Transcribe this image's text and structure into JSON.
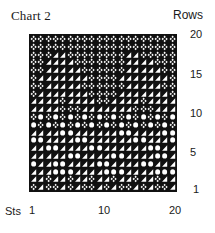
{
  "chart_data": {
    "type": "table",
    "title": "Chart 2",
    "xlabel": "Sts",
    "ylabel": "Rows",
    "x_ticks": [
      "1",
      "10",
      "20"
    ],
    "y_ticks": [
      "20",
      "15",
      "10",
      "5",
      "1"
    ],
    "columns": 20,
    "rows": 20,
    "legend": {
      "x": "lattice cross",
      "t": "triangle",
      "o": "circle"
    },
    "grid_rows_top_to_bottom": [
      "xxxxxxxxxxxxxxxxxxxx",
      "xxxxxxxxxxxxxxxxxxxx",
      "xxxttxxxxxxxxttxxxxx",
      "xxttttxxxxxxxttttxxx",
      "xxtttttxxxxxxtttttxx",
      "xtttttttxxxxtttttttx",
      "xxtttttxxxxxxtttttxx",
      "xtttttttxxxxtttttttx",
      "ttttxttttxxttttxtttt",
      "ttttxxxtttttttxxxttt",
      "xoxoxoxoxoxoxoxoxoxo",
      "oxoxoxoxoxoxoxoxoxox",
      "ttttoottttttoottttoo",
      "oottttoottttttoottto",
      "ttoottttoottttttoott",
      "tttttoottttoottttoot",
      "ottoottttoottttoottt",
      "tttooottttooottttooo",
      "ttxttxttxttxttxttxtt",
      "xtxxtxtxxtxtxxtxtxxt"
    ]
  },
  "labels": {
    "title": "Chart 2",
    "rows": "Rows",
    "sts": "Sts",
    "y20": "20",
    "y15": "15",
    "y10": "10",
    "y5": "5",
    "y1": "1",
    "x1": "1",
    "x10": "10",
    "x20": "20"
  },
  "colors": {
    "ink": "#111111",
    "paper": "#ffffff"
  }
}
